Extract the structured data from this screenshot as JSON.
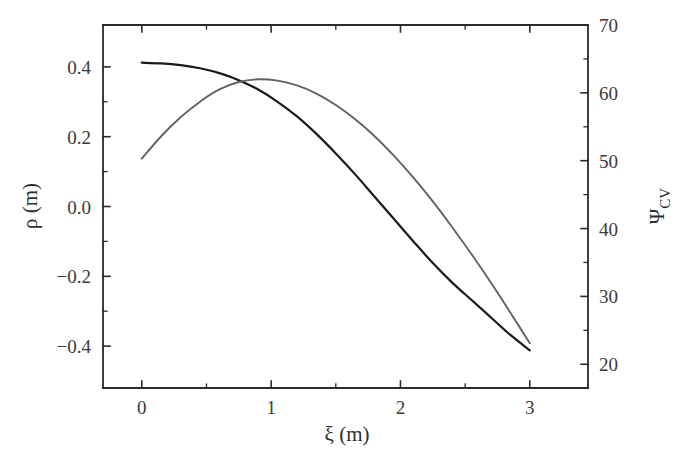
{
  "chart_data": {
    "type": "line",
    "title": "",
    "subtitle": "",
    "xlabel": "ξ (m)",
    "ylabel": "ρ (m)",
    "ylabel_right_symbol": "Ψ",
    "ylabel_right_subscript": "CV",
    "ylabel_right": "Ψ_CV",
    "grid": false,
    "legend": "none",
    "xlim": [
      -0.3,
      3.45
    ],
    "ylim": [
      -0.52,
      0.52
    ],
    "ylim_right": [
      16.5,
      70
    ],
    "xticks": [
      0,
      1,
      2,
      3
    ],
    "xtick_labels": [
      "0",
      "1",
      "2",
      "3"
    ],
    "xminorticks": [
      0.5,
      1.5,
      2.5
    ],
    "yticks": [
      -0.4,
      -0.2,
      0.0,
      0.2,
      0.4
    ],
    "ytick_labels": [
      "−0.4",
      "−0.2",
      "0.0",
      "0.2",
      "0.4"
    ],
    "yminorticks": [
      -0.3,
      -0.1,
      0.1,
      0.3
    ],
    "yticks_right": [
      20,
      30,
      40,
      50,
      60,
      70
    ],
    "ytick_labels_right": [
      "20",
      "30",
      "40",
      "50",
      "60",
      "70"
    ],
    "yminorticks_right": [
      25,
      35,
      45,
      55,
      65
    ],
    "series": [
      {
        "name": "rho",
        "axis": "left",
        "color": "#1a1a1a",
        "linewidth": 2.2,
        "x": [
          0.0,
          0.15,
          0.3,
          0.45,
          0.6,
          0.75,
          0.9,
          1.05,
          1.2,
          1.35,
          1.5,
          1.65,
          1.8,
          1.95,
          2.1,
          2.25,
          2.4,
          2.55,
          2.7,
          2.85,
          3.0
        ],
        "values": [
          0.412,
          0.41,
          0.405,
          0.396,
          0.382,
          0.362,
          0.335,
          0.3,
          0.258,
          0.208,
          0.152,
          0.092,
          0.028,
          -0.036,
          -0.1,
          -0.162,
          -0.218,
          -0.268,
          -0.318,
          -0.368,
          -0.412
        ]
      },
      {
        "name": "psi_CV",
        "axis": "right",
        "color": "#636363",
        "linewidth": 1.9,
        "x": [
          0.0,
          0.15,
          0.3,
          0.45,
          0.6,
          0.75,
          0.9,
          1.05,
          1.2,
          1.35,
          1.5,
          1.65,
          1.8,
          1.95,
          2.1,
          2.25,
          2.4,
          2.55,
          2.7,
          2.85,
          3.0
        ],
        "values": [
          50.3,
          53.6,
          56.4,
          58.7,
          60.5,
          61.6,
          62.0,
          61.8,
          61.1,
          59.9,
          58.2,
          56.1,
          53.6,
          50.7,
          47.5,
          44.0,
          40.2,
          36.2,
          32.0,
          27.6,
          23.1
        ]
      }
    ],
    "annotations": []
  },
  "figure": {
    "background": "#ffffff",
    "frame_color": "#2b2b2b",
    "tick_color": "#2b2b2b",
    "text_color": "#3a3a3a"
  }
}
